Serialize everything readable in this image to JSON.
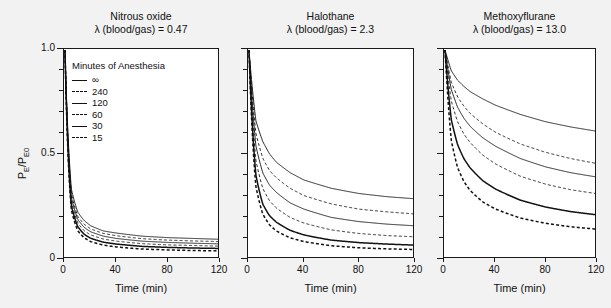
{
  "figure": {
    "background_color": "#f2f2f2",
    "plot_background_color": "#ffffff",
    "axis_color": "#1a1a1a",
    "xlabel": "Time (min)",
    "ylabel_main": "P",
    "ylabel_sub1": "E",
    "ylabel_mid": "/P",
    "ylabel_sub2": "E0",
    "legend": {
      "title": "Minutes of Anesthesia",
      "entries": [
        {
          "label": "∞",
          "style": "solid",
          "weight": "normal"
        },
        {
          "label": "240",
          "style": "dashed",
          "weight": "normal"
        },
        {
          "label": "120",
          "style": "solid",
          "weight": "normal"
        },
        {
          "label": "60",
          "style": "dashed",
          "weight": "normal"
        },
        {
          "label": "30",
          "style": "solid",
          "weight": "thick"
        },
        {
          "label": "15",
          "style": "dashed",
          "weight": "thick"
        }
      ]
    }
  },
  "chart_data": {
    "type": "line",
    "xlabel": "Time (min)",
    "ylabel": "PE/PE0",
    "xlim": [
      0,
      120
    ],
    "ylim": [
      0,
      1.0
    ],
    "xticks": [
      0,
      40,
      80,
      120
    ],
    "xtick_labels": [
      "0",
      "40",
      "80",
      "120"
    ],
    "yticks": [
      0,
      0.5,
      1.0
    ],
    "ytick_labels": [
      "0",
      "0.5",
      "1.0"
    ],
    "yminor_ticks": [
      0.1,
      0.2,
      0.3,
      0.4,
      0.6,
      0.7,
      0.8,
      0.9
    ],
    "grid": false,
    "legend_position": "upper-left of first panel",
    "legend_title": "Minutes of Anesthesia",
    "series_names": [
      "∞",
      "240",
      "120",
      "60",
      "30",
      "15"
    ],
    "panels": [
      {
        "name": "Nitrous oxide",
        "title": "Nitrous oxide",
        "subtitle": "λ (blood/gas) = 0.47",
        "lambda_blood_gas": 0.47,
        "x": [
          0,
          5,
          10,
          15,
          20,
          30,
          40,
          60,
          80,
          100,
          120
        ],
        "series": [
          {
            "name": "∞",
            "style": "solid",
            "weight": "normal",
            "values": [
              1.0,
              0.33,
              0.22,
              0.18,
              0.155,
              0.13,
              0.12,
              0.105,
              0.098,
              0.094,
              0.09
            ]
          },
          {
            "name": "240",
            "style": "dashed",
            "weight": "normal",
            "values": [
              1.0,
              0.31,
              0.2,
              0.162,
              0.14,
              0.118,
              0.107,
              0.093,
              0.086,
              0.082,
              0.079
            ]
          },
          {
            "name": "120",
            "style": "solid",
            "weight": "normal",
            "values": [
              1.0,
              0.29,
              0.185,
              0.147,
              0.126,
              0.105,
              0.094,
              0.081,
              0.075,
              0.071,
              0.068
            ]
          },
          {
            "name": "60",
            "style": "dashed",
            "weight": "normal",
            "values": [
              1.0,
              0.27,
              0.168,
              0.131,
              0.111,
              0.091,
              0.081,
              0.069,
              0.063,
              0.06,
              0.057
            ]
          },
          {
            "name": "30",
            "style": "solid",
            "weight": "thick",
            "values": [
              1.0,
              0.25,
              0.15,
              0.114,
              0.095,
              0.076,
              0.067,
              0.056,
              0.051,
              0.048,
              0.046
            ]
          },
          {
            "name": "15",
            "style": "dashed",
            "weight": "thick",
            "values": [
              1.0,
              0.23,
              0.131,
              0.097,
              0.079,
              0.062,
              0.053,
              0.043,
              0.039,
              0.036,
              0.034
            ]
          }
        ]
      },
      {
        "name": "Halothane",
        "title": "Halothane",
        "subtitle": "λ (blood/gas) = 2.3",
        "lambda_blood_gas": 2.3,
        "x": [
          0,
          5,
          10,
          15,
          20,
          30,
          40,
          60,
          80,
          100,
          120
        ],
        "series": [
          {
            "name": "∞",
            "style": "solid",
            "weight": "normal",
            "values": [
              1.0,
              0.66,
              0.56,
              0.5,
              0.46,
              0.41,
              0.375,
              0.335,
              0.31,
              0.295,
              0.285
            ]
          },
          {
            "name": "240",
            "style": "dashed",
            "weight": "normal",
            "values": [
              1.0,
              0.6,
              0.48,
              0.42,
              0.385,
              0.335,
              0.3,
              0.26,
              0.235,
              0.222,
              0.212
            ]
          },
          {
            "name": "120",
            "style": "solid",
            "weight": "normal",
            "values": [
              1.0,
              0.54,
              0.41,
              0.35,
              0.315,
              0.265,
              0.235,
              0.195,
              0.175,
              0.163,
              0.155
            ]
          },
          {
            "name": "60",
            "style": "dashed",
            "weight": "normal",
            "values": [
              1.0,
              0.47,
              0.335,
              0.275,
              0.24,
              0.195,
              0.168,
              0.135,
              0.118,
              0.108,
              0.102
            ]
          },
          {
            "name": "30",
            "style": "solid",
            "weight": "thick",
            "values": [
              1.0,
              0.4,
              0.26,
              0.203,
              0.172,
              0.133,
              0.111,
              0.086,
              0.074,
              0.067,
              0.062
            ]
          },
          {
            "name": "15",
            "style": "dashed",
            "weight": "thick",
            "values": [
              1.0,
              0.345,
              0.212,
              0.159,
              0.13,
              0.097,
              0.079,
              0.059,
              0.049,
              0.044,
              0.041
            ]
          }
        ]
      },
      {
        "name": "Methoxyflurane",
        "title": "Methoxyflurane",
        "subtitle": "λ (blood/gas) = 13.0",
        "lambda_blood_gas": 13.0,
        "x": [
          0,
          5,
          10,
          15,
          20,
          30,
          40,
          60,
          80,
          100,
          120
        ],
        "series": [
          {
            "name": "∞",
            "style": "solid",
            "weight": "normal",
            "values": [
              1.0,
              0.9,
              0.855,
              0.825,
              0.8,
              0.765,
              0.735,
              0.69,
              0.655,
              0.63,
              0.61
            ]
          },
          {
            "name": "240",
            "style": "dashed",
            "weight": "normal",
            "values": [
              1.0,
              0.845,
              0.775,
              0.73,
              0.695,
              0.645,
              0.605,
              0.548,
              0.508,
              0.478,
              0.455
            ]
          },
          {
            "name": "120",
            "style": "solid",
            "weight": "normal",
            "values": [
              1.0,
              0.81,
              0.725,
              0.672,
              0.633,
              0.578,
              0.538,
              0.478,
              0.438,
              0.41,
              0.39
            ]
          },
          {
            "name": "60",
            "style": "dashed",
            "weight": "normal",
            "values": [
              1.0,
              0.755,
              0.655,
              0.596,
              0.555,
              0.495,
              0.453,
              0.393,
              0.355,
              0.328,
              0.31
            ]
          },
          {
            "name": "30",
            "style": "solid",
            "weight": "thick",
            "values": [
              1.0,
              0.665,
              0.545,
              0.478,
              0.433,
              0.372,
              0.332,
              0.278,
              0.245,
              0.223,
              0.208
            ]
          },
          {
            "name": "15",
            "style": "dashed",
            "weight": "thick",
            "values": [
              1.0,
              0.565,
              0.435,
              0.368,
              0.325,
              0.27,
              0.236,
              0.192,
              0.167,
              0.15,
              0.139
            ]
          }
        ]
      }
    ]
  }
}
